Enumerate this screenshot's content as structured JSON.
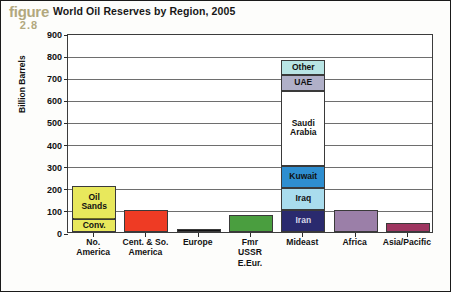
{
  "figure": {
    "word": "figure",
    "number": "2.8",
    "color": "#b2a87e"
  },
  "chart_data": {
    "type": "bar",
    "stacked": true,
    "title": "World Oil Reserves by Region, 2005",
    "xlabel": "",
    "ylabel": "Billion Barrels",
    "ylim": [
      0,
      900
    ],
    "ytick_step": 100,
    "yticks": [
      "900",
      "800",
      "700",
      "600",
      "500",
      "400",
      "300",
      "200",
      "100",
      "0"
    ],
    "grid": true,
    "legend": "none (in-bar labels)",
    "categories": [
      "No.\nAmerica",
      "Cent. & So.\nAmerica",
      "Europe",
      "Fmr\nUSSR\nE.Eur.",
      "Mideast",
      "Africa",
      "Asia/Pacific"
    ],
    "totals": [
      210,
      98,
      12,
      78,
      780,
      100,
      40
    ],
    "bars": [
      {
        "category": "No.\nAmerica",
        "total": 210,
        "segments": [
          {
            "name": "Conv.",
            "label": "Conv.",
            "value": 60,
            "color": "#e8e85c",
            "text_color": "#111111"
          },
          {
            "name": "Oil Sands",
            "label": "Oil\nSands",
            "value": 150,
            "color": "#e8e85c",
            "text_color": "#111111"
          }
        ]
      },
      {
        "category": "Cent. & So.\nAmerica",
        "total": 98,
        "segments": [
          {
            "name": "Cent. & So. America",
            "label": "",
            "value": 98,
            "color": "#ee3b24",
            "text_color": "#ffffff"
          }
        ]
      },
      {
        "category": "Europe",
        "total": 12,
        "segments": [
          {
            "name": "Europe",
            "label": "",
            "value": 12,
            "color": "#111111",
            "text_color": "#ffffff"
          }
        ]
      },
      {
        "category": "Fmr\nUSSR\nE.Eur.",
        "total": 78,
        "segments": [
          {
            "name": "Fmr USSR E.Eur.",
            "label": "",
            "value": 78,
            "color": "#4a9e3f",
            "text_color": "#ffffff"
          }
        ]
      },
      {
        "category": "Mideast",
        "total": 780,
        "segments": [
          {
            "name": "Iran",
            "label": "Iran",
            "value": 100,
            "color": "#2a2a6e",
            "text_color": "#d8d8e8"
          },
          {
            "name": "Iraq",
            "label": "Iraq",
            "value": 100,
            "color": "#a9dced",
            "text_color": "#111111"
          },
          {
            "name": "Kuwait",
            "label": "Kuwait",
            "value": 100,
            "color": "#2e8ed0",
            "text_color": "#111111"
          },
          {
            "name": "Saudi Arabia",
            "label": "Saudi\nArabia",
            "value": 340,
            "color": "#ffffff",
            "text_color": "#111111"
          },
          {
            "name": "UAE",
            "label": "UAE",
            "value": 70,
            "color": "#b0b0c8",
            "text_color": "#111111"
          },
          {
            "name": "Other",
            "label": "Other",
            "value": 70,
            "color": "#b8e4e4",
            "text_color": "#111111"
          }
        ]
      },
      {
        "category": "Africa",
        "total": 100,
        "segments": [
          {
            "name": "Africa",
            "label": "",
            "value": 100,
            "color": "#9b7fa8",
            "text_color": "#ffffff"
          }
        ]
      },
      {
        "category": "Asia/Pacific",
        "total": 40,
        "segments": [
          {
            "name": "Asia/Pacific",
            "label": "",
            "value": 40,
            "color": "#9e3560",
            "text_color": "#ffffff"
          }
        ]
      }
    ]
  }
}
